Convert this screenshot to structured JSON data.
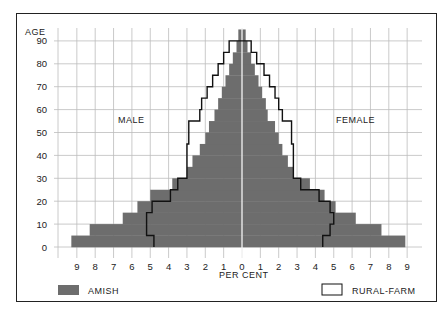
{
  "chart_data": {
    "type": "bar",
    "subtype": "population-pyramid",
    "title": "",
    "ylabel": "AGE",
    "xlabel": "PER CENT",
    "y_ticks": [
      0,
      10,
      20,
      30,
      40,
      50,
      60,
      70,
      80,
      90
    ],
    "x_ticks_left": [
      9,
      8,
      7,
      6,
      5,
      4,
      3,
      2,
      1,
      0
    ],
    "x_ticks_right": [
      0,
      1,
      2,
      3,
      4,
      5,
      6,
      7,
      8,
      9
    ],
    "xlim": [
      -9,
      9
    ],
    "ylim": [
      0,
      90
    ],
    "grid": true,
    "side_labels": {
      "left": "MALE",
      "right": "FEMALE"
    },
    "age_groups": [
      "0-4",
      "5-9",
      "10-14",
      "15-19",
      "20-24",
      "25-29",
      "30-34",
      "35-39",
      "40-44",
      "45-49",
      "50-54",
      "55-59",
      "60-64",
      "65-69",
      "70-74",
      "75-79",
      "80-84",
      "85-89",
      "90+"
    ],
    "series": [
      {
        "name": "AMISH",
        "style": "filled",
        "male": [
          9.3,
          8.3,
          6.5,
          5.7,
          5.0,
          3.8,
          3.0,
          2.7,
          2.3,
          2.0,
          1.8,
          1.5,
          1.3,
          1.1,
          0.9,
          0.7,
          0.5,
          0.3,
          0.2
        ],
        "female": [
          8.9,
          7.6,
          6.2,
          5.1,
          4.5,
          3.7,
          2.8,
          2.5,
          2.2,
          2.0,
          1.8,
          1.4,
          1.3,
          1.1,
          0.9,
          0.7,
          0.5,
          0.3,
          0.2
        ]
      },
      {
        "name": "RURAL-FARM",
        "style": "outline",
        "male": [
          4.8,
          5.2,
          5.2,
          4.9,
          3.9,
          3.5,
          3.0,
          3.0,
          3.0,
          2.9,
          2.9,
          2.3,
          2.2,
          1.9,
          1.6,
          1.3,
          1.0,
          0.7,
          0.0
        ],
        "female": [
          4.4,
          4.8,
          5.0,
          4.8,
          4.2,
          3.2,
          2.8,
          2.8,
          2.8,
          2.7,
          2.7,
          2.2,
          2.0,
          1.8,
          1.5,
          1.2,
          0.8,
          0.5,
          0.0
        ]
      }
    ],
    "legend": [
      {
        "label": "AMISH",
        "swatch": "filled",
        "position": "bottom-left"
      },
      {
        "label": "RURAL-FARM",
        "swatch": "outline",
        "position": "bottom-right"
      }
    ],
    "colors": {
      "amish_fill": "#6d6d6d",
      "outline": "#111111",
      "grid": "#bdbdbd",
      "center_line": "#ffffff"
    }
  },
  "labels": {
    "age": "AGE",
    "male": "MALE",
    "female": "FEMALE",
    "per_cent": "PER CENT",
    "legend_amish": "AMISH",
    "legend_rural": "RURAL-FARM"
  }
}
